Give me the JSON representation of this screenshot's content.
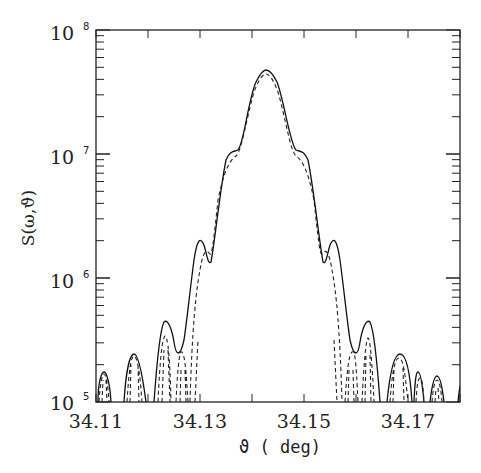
{
  "chart_data": {
    "type": "line",
    "title": "",
    "xlabel": "ϑ ( deg)",
    "ylabel": "S(ω,ϑ)",
    "xlim": [
      34.11,
      34.18
    ],
    "ylim": [
      100000,
      100000000
    ],
    "yscale": "log",
    "grid": false,
    "legend": null,
    "x_ticks": [
      "34.11",
      "34.13",
      "34.15",
      "34.17"
    ],
    "y_ticks": [
      {
        "base": "10",
        "exp": "5"
      },
      {
        "base": "10",
        "exp": "6"
      },
      {
        "base": "10",
        "exp": "7"
      },
      {
        "base": "10",
        "exp": "8"
      }
    ],
    "series": [
      {
        "name": "solid",
        "style": "solid",
        "x": [
          34.1105,
          34.1115,
          34.1125,
          34.1155,
          34.1165,
          34.1185,
          34.1215,
          34.1225,
          34.1245,
          34.1265,
          34.1275,
          34.1305,
          34.1315,
          34.1355,
          34.1375,
          34.1435,
          34.1495,
          34.1515,
          34.1555,
          34.1565,
          34.1605,
          34.1625,
          34.1645,
          34.1665,
          34.1705,
          34.1725,
          34.1745,
          34.1765
        ],
        "values": [
          250000,
          260000,
          100000,
          420000,
          100000,
          100000,
          800000,
          600000,
          350000,
          800000,
          2100000,
          1300000,
          2000000,
          10000000,
          10500000,
          45000000,
          10500000,
          10000000,
          1300000,
          2100000,
          1300000,
          800000,
          420000,
          800000,
          420000,
          420000,
          100000,
          270000
        ]
      },
      {
        "name": "dashed",
        "style": "dashed",
        "x": [
          34.1105,
          34.1125,
          34.1165,
          34.1195,
          34.1225,
          34.1255,
          34.1285,
          34.1335,
          34.1375,
          34.1435,
          34.1495,
          34.1545,
          34.1585,
          34.1625,
          34.1665,
          34.1705,
          34.1745
        ],
        "values": [
          240000,
          100000,
          420000,
          100000,
          700000,
          600000,
          1600000,
          8500000,
          9000000,
          42000000,
          9000000,
          8500000,
          1600000,
          700000,
          700000,
          420000,
          240000
        ]
      }
    ]
  }
}
